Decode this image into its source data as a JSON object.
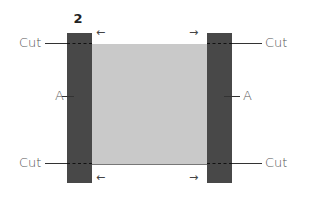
{
  "diagram": {
    "step_number": "2",
    "labels": {
      "cut_top_left": "Cut",
      "cut_bottom_left": "Cut",
      "cut_top_right": "Cut",
      "cut_bottom_right": "Cut",
      "a_left": "A",
      "a_right": "A"
    },
    "arrows": {
      "top_left": "←",
      "top_right": "→",
      "bottom_left": "←",
      "bottom_right": "→"
    },
    "colors": {
      "strip": "#484848",
      "fabric": "#c9c9c9",
      "text": "#555555"
    }
  }
}
